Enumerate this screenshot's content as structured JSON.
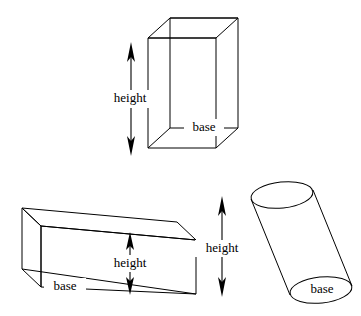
{
  "figure": {
    "background_color": "#ffffff",
    "stroke_color": "#000000",
    "width": 361,
    "height": 316
  },
  "solids": [
    {
      "id": "rectangular-prism",
      "name": "rectangular prism",
      "height_label": "height",
      "base_label": "base"
    },
    {
      "id": "wedge-prism",
      "name": "oblique wedge prism",
      "height_label": "height",
      "base_label": "base"
    },
    {
      "id": "oblique-cylinder",
      "name": "oblique cylinder",
      "height_label": "height",
      "base_label": "base"
    }
  ],
  "labels": {
    "prism_height": "height",
    "prism_base": "base",
    "wedge_height": "height",
    "wedge_base": "base",
    "cylinder_height": "height",
    "cylinder_base": "base"
  }
}
